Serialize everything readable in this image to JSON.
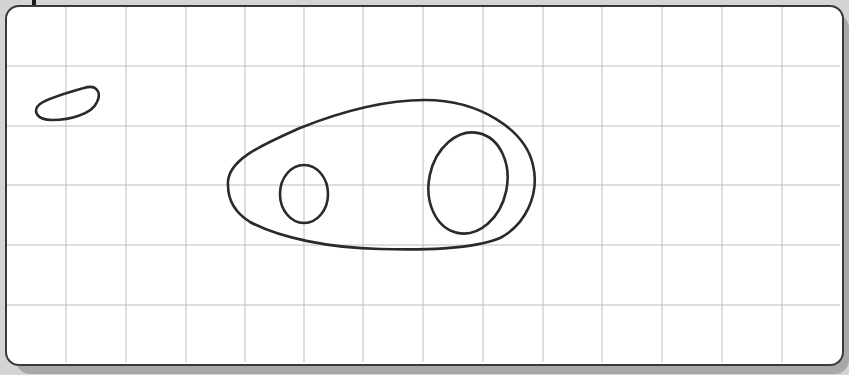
{
  "diagram": {
    "type": "grid-sketch",
    "background_color": "#d4d4d4",
    "panel_color": "#ffffff",
    "grid": {
      "line_color": "#bdbdbd",
      "vertical_x": [
        66,
        126,
        186,
        245,
        304,
        363,
        423,
        483,
        543,
        602,
        662,
        722,
        782
      ],
      "horizontal_y": [
        66,
        126,
        185,
        245,
        305
      ]
    },
    "shapes": [
      {
        "name": "small-blob",
        "stroke": "#2a2a2a"
      },
      {
        "name": "large-outer-shape",
        "stroke": "#2a2a2a"
      },
      {
        "name": "small-inner-ellipse",
        "stroke": "#2a2a2a",
        "cx": 304,
        "cy": 194,
        "rx": 24,
        "ry": 29
      },
      {
        "name": "large-inner-ellipse",
        "stroke": "#2a2a2a",
        "cx": 468,
        "cy": 183,
        "rx": 39,
        "ry": 51
      }
    ]
  }
}
